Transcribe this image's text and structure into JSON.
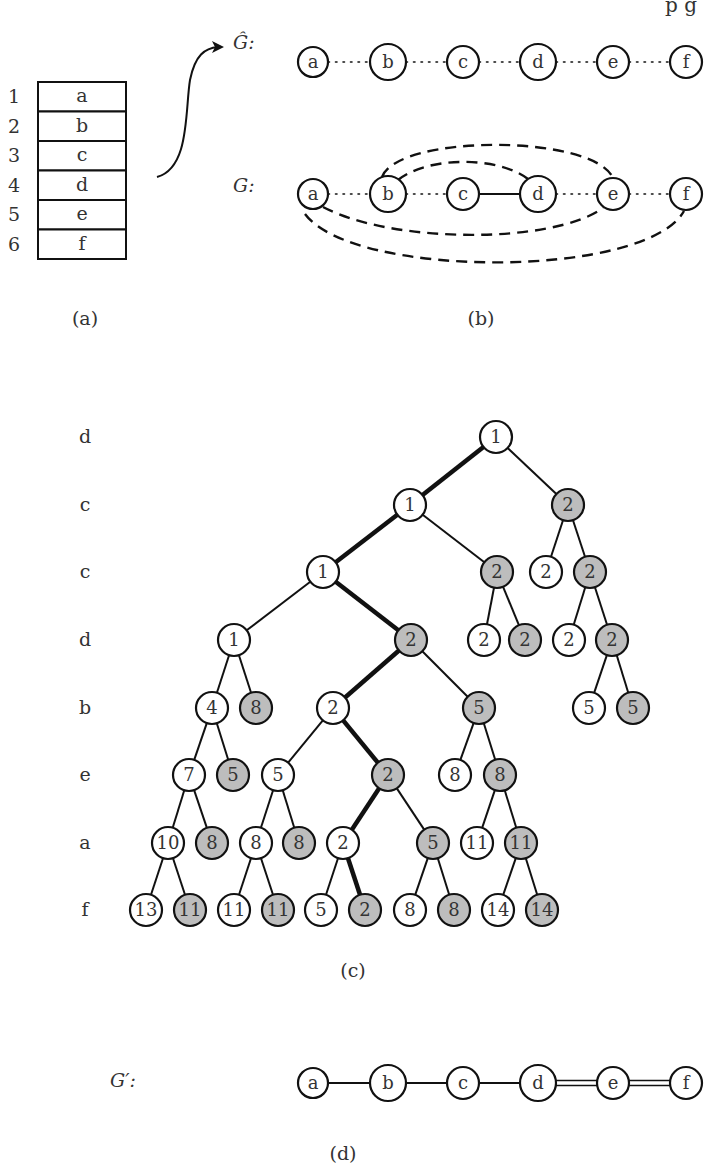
{
  "header": {
    "partial_text": "p g"
  },
  "panel_a": {
    "caption": "(a)",
    "rows": [
      {
        "index": "1",
        "value": "a"
      },
      {
        "index": "2",
        "value": "b"
      },
      {
        "index": "3",
        "value": "c"
      },
      {
        "index": "4",
        "value": "d"
      },
      {
        "index": "5",
        "value": "e"
      },
      {
        "index": "6",
        "value": "f"
      }
    ]
  },
  "panel_b": {
    "caption": "(b)",
    "g_hat": {
      "label": "Ĝ:",
      "nodes": [
        "a",
        "b",
        "c",
        "d",
        "e",
        "f"
      ],
      "edges": [
        {
          "from": "a",
          "to": "b",
          "style": "dotted"
        },
        {
          "from": "b",
          "to": "c",
          "style": "dotted"
        },
        {
          "from": "c",
          "to": "d",
          "style": "dotted"
        },
        {
          "from": "d",
          "to": "e",
          "style": "dotted"
        },
        {
          "from": "e",
          "to": "f",
          "style": "dotted"
        }
      ]
    },
    "g": {
      "label": "G:",
      "nodes": [
        "a",
        "b",
        "c",
        "d",
        "e",
        "f"
      ],
      "edges": [
        {
          "from": "a",
          "to": "b",
          "style": "dotted"
        },
        {
          "from": "b",
          "to": "c",
          "style": "dotted"
        },
        {
          "from": "c",
          "to": "d",
          "style": "solid"
        },
        {
          "from": "d",
          "to": "e",
          "style": "dotted"
        },
        {
          "from": "e",
          "to": "f",
          "style": "dotted"
        },
        {
          "from": "b",
          "to": "d",
          "style": "dashed"
        },
        {
          "from": "b",
          "to": "e",
          "style": "dashed"
        },
        {
          "from": "a",
          "to": "e",
          "style": "dashed"
        },
        {
          "from": "a",
          "to": "f",
          "style": "dashed"
        }
      ]
    }
  },
  "panel_c": {
    "caption": "(c)",
    "level_labels": [
      "d",
      "c",
      "c",
      "d",
      "b",
      "e",
      "a",
      "f"
    ],
    "levels": [
      [
        {
          "v": "1",
          "x": 496,
          "g": false
        }
      ],
      [
        {
          "v": "1",
          "x": 410,
          "g": false,
          "p": 0,
          "bold": true
        },
        {
          "v": "2",
          "x": 568,
          "g": true,
          "p": 0
        }
      ],
      [
        {
          "v": "1",
          "x": 323,
          "g": false,
          "p": 0,
          "bold": true
        },
        {
          "v": "2",
          "x": 497,
          "g": true,
          "p": 0
        },
        {
          "v": "2",
          "x": 546,
          "g": false,
          "p": 1
        },
        {
          "v": "2",
          "x": 590,
          "g": true,
          "p": 1
        }
      ],
      [
        {
          "v": "1",
          "x": 234,
          "g": false,
          "p": 0
        },
        {
          "v": "2",
          "x": 411,
          "g": true,
          "p": 0,
          "bold": true
        },
        {
          "v": "2",
          "x": 484,
          "g": false,
          "p": 1
        },
        {
          "v": "2",
          "x": 525,
          "g": true,
          "p": 1
        },
        {
          "v": "2",
          "x": 569,
          "g": false,
          "p": 3
        },
        {
          "v": "2",
          "x": 612,
          "g": true,
          "p": 3
        }
      ],
      [
        {
          "v": "4",
          "x": 212,
          "g": false,
          "p": 0
        },
        {
          "v": "8",
          "x": 256,
          "g": true,
          "p": 0
        },
        {
          "v": "2",
          "x": 333,
          "g": false,
          "p": 1,
          "bold": true
        },
        {
          "v": "5",
          "x": 479,
          "g": true,
          "p": 1
        },
        {
          "v": "5",
          "x": 589,
          "g": false,
          "p": 5
        },
        {
          "v": "5",
          "x": 633,
          "g": true,
          "p": 5
        }
      ],
      [
        {
          "v": "7",
          "x": 189,
          "g": false,
          "p": 0
        },
        {
          "v": "5",
          "x": 233,
          "g": true,
          "p": 0
        },
        {
          "v": "5",
          "x": 278,
          "g": false,
          "p": 2
        },
        {
          "v": "2",
          "x": 388,
          "g": true,
          "p": 2,
          "bold": true
        },
        {
          "v": "8",
          "x": 455,
          "g": false,
          "p": 3
        },
        {
          "v": "8",
          "x": 500,
          "g": true,
          "p": 3
        }
      ],
      [
        {
          "v": "10",
          "x": 168,
          "g": false,
          "p": 0
        },
        {
          "v": "8",
          "x": 212,
          "g": true,
          "p": 0
        },
        {
          "v": "8",
          "x": 256,
          "g": false,
          "p": 2
        },
        {
          "v": "8",
          "x": 299,
          "g": true,
          "p": 2
        },
        {
          "v": "2",
          "x": 343,
          "g": false,
          "p": 3,
          "bold": true
        },
        {
          "v": "5",
          "x": 433,
          "g": true,
          "p": 3
        },
        {
          "v": "11",
          "x": 477,
          "g": false,
          "p": 5
        },
        {
          "v": "11",
          "x": 521,
          "g": true,
          "p": 5
        }
      ],
      [
        {
          "v": "13",
          "x": 146,
          "g": false,
          "p": 0
        },
        {
          "v": "11",
          "x": 190,
          "g": true,
          "p": 0
        },
        {
          "v": "11",
          "x": 234,
          "g": false,
          "p": 2
        },
        {
          "v": "11",
          "x": 278,
          "g": true,
          "p": 2
        },
        {
          "v": "5",
          "x": 321,
          "g": false,
          "p": 4
        },
        {
          "v": "2",
          "x": 365,
          "g": true,
          "p": 4,
          "bold": true
        },
        {
          "v": "8",
          "x": 410,
          "g": false,
          "p": 5
        },
        {
          "v": "8",
          "x": 454,
          "g": true,
          "p": 5
        },
        {
          "v": "14",
          "x": 498,
          "g": false,
          "p": 7
        },
        {
          "v": "14",
          "x": 542,
          "g": true,
          "p": 7
        }
      ]
    ]
  },
  "panel_d": {
    "caption": "(d)",
    "label": "G′:",
    "nodes": [
      "a",
      "b",
      "c",
      "d",
      "e",
      "f"
    ],
    "edges": [
      {
        "from": "a",
        "to": "b",
        "style": "single"
      },
      {
        "from": "b",
        "to": "c",
        "style": "single"
      },
      {
        "from": "c",
        "to": "d",
        "style": "single"
      },
      {
        "from": "d",
        "to": "e",
        "style": "double"
      },
      {
        "from": "e",
        "to": "f",
        "style": "double"
      }
    ]
  },
  "colors": {
    "stroke": "#111111",
    "gray_fill": "#bdbdbd",
    "text": "#333333"
  }
}
